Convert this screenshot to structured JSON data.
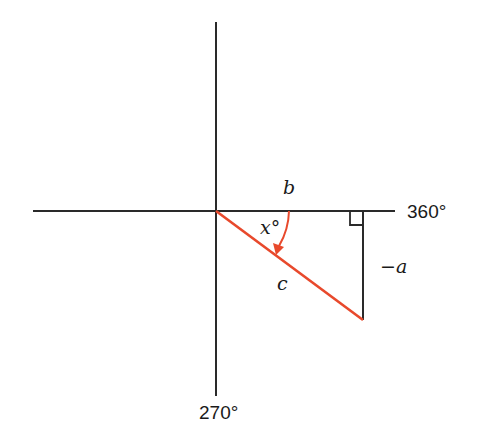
{
  "diagram": {
    "type": "reference-angle-triangle",
    "colors": {
      "axis": "#2a2a2a",
      "hypotenuse": "#e8492c",
      "arc": "#e8492c",
      "text": "#1a1a1a"
    },
    "axes": {
      "positive_x_label": "360°",
      "negative_y_label": "270°"
    },
    "triangle": {
      "adjacent_label": "b",
      "opposite_label": "−a",
      "hypotenuse_label": "c",
      "angle_label": "x°",
      "right_angle_marker": true
    }
  }
}
